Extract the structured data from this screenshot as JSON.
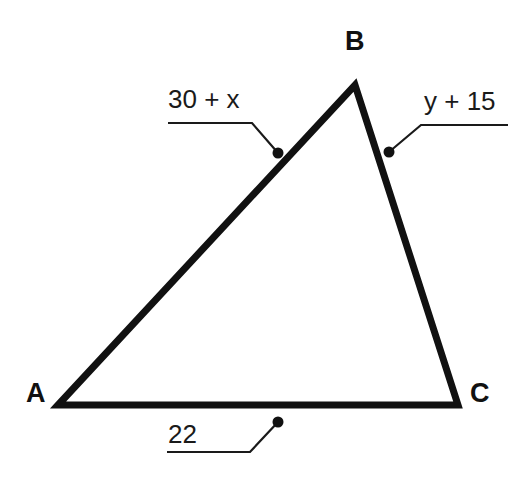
{
  "figure": {
    "type": "triangle-diagram",
    "background_color": "#ffffff",
    "stroke_color": "#111111",
    "leader_color": "#1a1a1a"
  },
  "vertices": {
    "a": {
      "label": "A",
      "x": 58,
      "y": 405
    },
    "b": {
      "label": "B",
      "x": 355,
      "y": 85
    },
    "c": {
      "label": "C",
      "x": 458,
      "y": 405
    }
  },
  "sides": [
    {
      "name": "side-ab",
      "label": "30 + x",
      "from": "A",
      "to": "B",
      "marker": {
        "x": 278,
        "y": 153
      }
    },
    {
      "name": "side-bc",
      "label": "y + 15",
      "from": "B",
      "to": "C",
      "marker": {
        "x": 389,
        "y": 152
      }
    },
    {
      "name": "side-ca",
      "label": "22",
      "from": "C",
      "to": "A",
      "marker": {
        "x": 278,
        "y": 422
      }
    }
  ],
  "leaders": {
    "ab": {
      "path": "M 168 123 L 252 123 L 278 153"
    },
    "bc": {
      "path": "M 389 152 L 421 125 L 508 125"
    },
    "ca": {
      "path": "M 167 452 L 250 452 L 278 422"
    }
  },
  "triangle_path": "M 58 405 L 355 85 L 458 405 Z"
}
